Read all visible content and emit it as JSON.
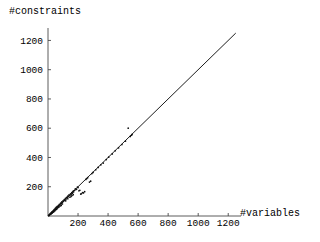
{
  "chart_data": {
    "type": "scatter",
    "title": "",
    "xlabel": "#variables",
    "ylabel": "#constraints",
    "xlim": [
      0,
      1285
    ],
    "ylim": [
      0,
      1285
    ],
    "grid": false,
    "legend": null,
    "xticks": [
      200,
      400,
      600,
      800,
      1000,
      1200
    ],
    "yticks": [
      200,
      400,
      600,
      800,
      1000,
      1200
    ],
    "xticklabels": [
      "200",
      "400",
      "600",
      "800",
      "1000",
      "1200"
    ],
    "yticklabels": [
      "200",
      "400",
      "600",
      "800",
      "1000",
      "1200"
    ],
    "annotations": [],
    "reference_line": {
      "name": "identity-line",
      "description": "y = x diagonal",
      "slope": 1,
      "intercept": 0,
      "x_start": 0,
      "y_start": 0,
      "x_end": 1250,
      "y_end": 1250
    },
    "series": [
      {
        "name": "instances",
        "marker": "point",
        "color": "#101010",
        "points": [
          [
            8,
            8
          ],
          [
            12,
            10
          ],
          [
            14,
            16
          ],
          [
            18,
            14
          ],
          [
            20,
            22
          ],
          [
            24,
            20
          ],
          [
            26,
            28
          ],
          [
            30,
            26
          ],
          [
            32,
            34
          ],
          [
            36,
            32
          ],
          [
            38,
            40
          ],
          [
            42,
            38
          ],
          [
            44,
            48
          ],
          [
            48,
            44
          ],
          [
            50,
            54
          ],
          [
            54,
            52
          ],
          [
            56,
            60
          ],
          [
            60,
            58
          ],
          [
            62,
            66
          ],
          [
            66,
            64
          ],
          [
            70,
            72
          ],
          [
            72,
            68
          ],
          [
            76,
            80
          ],
          [
            80,
            76
          ],
          [
            84,
            88
          ],
          [
            88,
            84
          ],
          [
            92,
            96
          ],
          [
            96,
            92
          ],
          [
            100,
            104
          ],
          [
            104,
            100
          ],
          [
            108,
            112
          ],
          [
            112,
            108
          ],
          [
            116,
            120
          ],
          [
            120,
            116
          ],
          [
            124,
            128
          ],
          [
            128,
            124
          ],
          [
            132,
            136
          ],
          [
            136,
            132
          ],
          [
            140,
            144
          ],
          [
            146,
            140
          ],
          [
            150,
            152
          ],
          [
            154,
            148
          ],
          [
            158,
            160
          ],
          [
            162,
            156
          ],
          [
            166,
            168
          ],
          [
            170,
            164
          ],
          [
            132,
            118
          ],
          [
            118,
            104
          ],
          [
            96,
            82
          ],
          [
            80,
            68
          ],
          [
            64,
            54
          ],
          [
            52,
            42
          ],
          [
            40,
            30
          ],
          [
            28,
            20
          ],
          [
            172,
            172
          ],
          [
            178,
            176
          ],
          [
            182,
            186
          ],
          [
            190,
            182
          ],
          [
            196,
            198
          ],
          [
            200,
            194
          ],
          [
            206,
            172
          ],
          [
            212,
            176
          ],
          [
            218,
            150
          ],
          [
            222,
            152
          ],
          [
            230,
            160
          ],
          [
            236,
            158
          ],
          [
            244,
            166
          ],
          [
            252,
            250
          ],
          [
            258,
            256
          ],
          [
            264,
            262
          ],
          [
            276,
            232
          ],
          [
            284,
            238
          ],
          [
            292,
            290
          ],
          [
            300,
            298
          ],
          [
            318,
            316
          ],
          [
            334,
            332
          ],
          [
            352,
            350
          ],
          [
            368,
            362
          ],
          [
            388,
            386
          ],
          [
            404,
            402
          ],
          [
            428,
            424
          ],
          [
            448,
            446
          ],
          [
            470,
            466
          ],
          [
            492,
            488
          ],
          [
            516,
            512
          ],
          [
            534,
            600
          ],
          [
            548,
            544
          ],
          [
            556,
            552
          ],
          [
            560,
            558
          ],
          [
            146,
            128
          ],
          [
            154,
            134
          ],
          [
            160,
            140
          ],
          [
            168,
            146
          ],
          [
            88,
            72
          ],
          [
            72,
            60
          ],
          [
            58,
            46
          ],
          [
            46,
            36
          ],
          [
            34,
            26
          ],
          [
            22,
            16
          ],
          [
            16,
            12
          ],
          [
            10,
            6
          ],
          [
            6,
            4
          ],
          [
            4,
            2
          ]
        ]
      }
    ]
  },
  "plot_geometry": {
    "origin_x_px": 48,
    "origin_y_px": 216,
    "x_axis_end_px": 241,
    "y_axis_top_px": 28,
    "px_per_unit_x": 0.15,
    "px_per_unit_y": 0.15
  }
}
